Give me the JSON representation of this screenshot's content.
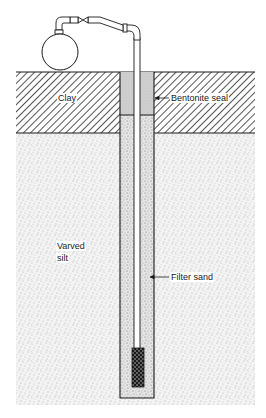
{
  "diagram": {
    "labels": {
      "clay": "Clay",
      "bentonite_seal": "Bentonite seal",
      "varved_silt_line1": "Varved",
      "varved_silt_line2": "silt",
      "filter_sand": "Filter sand"
    },
    "layers": [
      {
        "name": "Clay",
        "top": 72,
        "bottom": 133,
        "pattern": "diagonal-hatch"
      },
      {
        "name": "Varved silt",
        "top": 133,
        "bottom": 405,
        "pattern": "stipple"
      }
    ],
    "components": [
      "tank",
      "valve",
      "riser pipe",
      "bentonite seal",
      "filter sand",
      "well screen"
    ],
    "colors": {
      "line": "#1a1a1a",
      "hatch": "#2a2a2a",
      "stipple_bg": "#f2f2f2",
      "bentonite": "#cfcfcf",
      "background": "#ffffff"
    }
  }
}
